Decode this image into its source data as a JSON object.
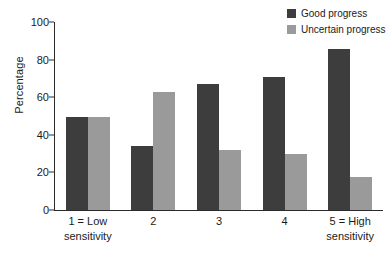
{
  "chart_data": {
    "type": "bar",
    "title": "",
    "xlabel": "",
    "ylabel": "Percentage",
    "ylim": [
      0,
      100
    ],
    "yticks": [
      0,
      20,
      40,
      60,
      80,
      100
    ],
    "ytick_labels": [
      "0",
      "20",
      "40",
      "60",
      "80",
      "100"
    ],
    "grid": false,
    "legend_position": "top-right",
    "categories": [
      "1 = Low sensitivity",
      "2",
      "3",
      "4",
      "5 = High sensitivity"
    ],
    "category_labels": [
      {
        "line1": "1 = Low",
        "line2": "sensitivity"
      },
      {
        "line1": "2",
        "line2": ""
      },
      {
        "line1": "3",
        "line2": ""
      },
      {
        "line1": "4",
        "line2": ""
      },
      {
        "line1": "5 = High",
        "line2": "sensitivity"
      }
    ],
    "series": [
      {
        "name": "Good progress",
        "color": "#3d3d3d",
        "values": [
          49.5,
          34,
          67,
          70.5,
          85.5
        ]
      },
      {
        "name": "Uncertain progress",
        "color": "#9a9a9a",
        "values": [
          49.5,
          63,
          32,
          30,
          17.5
        ]
      }
    ]
  },
  "legend": {
    "items": [
      {
        "label": "Good progress",
        "color": "#3d3d3d"
      },
      {
        "label": "Uncertain progress",
        "color": "#9a9a9a"
      }
    ]
  },
  "axes": {
    "y_title": "Percentage"
  }
}
